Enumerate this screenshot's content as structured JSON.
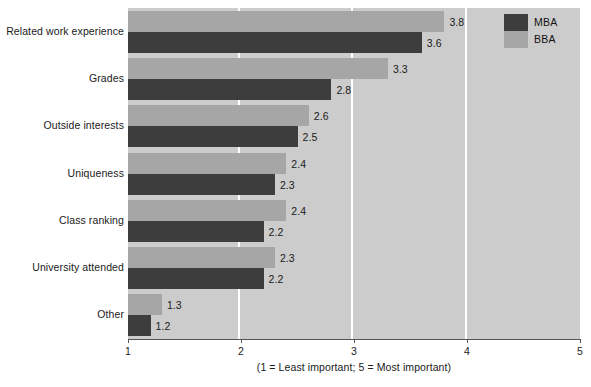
{
  "chart_data": {
    "type": "bar",
    "orientation": "horizontal",
    "title": "",
    "xlabel": "(1 = Least important; 5 = Most important)",
    "ylabel": "",
    "xlim": [
      1,
      5
    ],
    "xticks": [
      "1",
      "2",
      "3",
      "4",
      "5"
    ],
    "grid": true,
    "legend_position": "top-right",
    "categories": [
      "Related work experience",
      "Grades",
      "Outside interests",
      "Uniqueness",
      "Class ranking",
      "University attended",
      "Other"
    ],
    "series": [
      {
        "name": "BBA",
        "color": "#a6a6a6",
        "values": [
          3.8,
          3.3,
          2.6,
          2.4,
          2.4,
          2.3,
          1.3
        ],
        "labels": [
          "3.8",
          "3.3",
          "2.6",
          "2.4",
          "2.4",
          "2.3",
          "1.3"
        ]
      },
      {
        "name": "MBA",
        "color": "#3d3d3d",
        "values": [
          3.6,
          2.8,
          2.5,
          2.3,
          2.2,
          2.2,
          1.2
        ],
        "labels": [
          "3.6",
          "2.8",
          "2.5",
          "2.3",
          "2.2",
          "2.2",
          "1.2"
        ]
      }
    ]
  },
  "legend": {
    "items": [
      {
        "label": "MBA",
        "color": "#3d3d3d"
      },
      {
        "label": "BBA",
        "color": "#a6a6a6"
      }
    ]
  },
  "axis": {
    "caption": "(1 = Least important; 5 = Most important)",
    "ticks": [
      "1",
      "2",
      "3",
      "4",
      "5"
    ]
  },
  "colors": {
    "plot_background": "#cccccc",
    "gridline": "#ffffff",
    "bar_bba": "#a6a6a6",
    "bar_mba": "#3d3d3d",
    "text": "#1a1a1a",
    "page_background": "#ffffff"
  }
}
